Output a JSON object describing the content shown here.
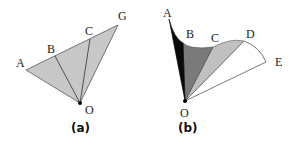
{
  "figures": [
    {
      "id": "a",
      "caption": "(a)",
      "description": "Triangle AGO divided into three wedges by segments OB and OC, all shaded light gray",
      "labels": {
        "A": "A",
        "B": "B",
        "C": "C",
        "G": "G",
        "O": "O"
      },
      "colors": {
        "fill": "#c8c8c8",
        "stroke": "#444444",
        "origin": "#000000"
      }
    },
    {
      "id": "b",
      "caption": "(b)",
      "description": "Curved fan region from O bounded by curve A-B-C-D-E, wedges shaded black, dark gray, light gray, white",
      "labels": {
        "A": "A",
        "B": "B",
        "C": "C",
        "D": "D",
        "E": "E",
        "O": "O"
      },
      "colors": {
        "wedge_OAB": "#0a0a0a",
        "wedge_OBC": "#7a7a7a",
        "wedge_OCD": "#c0c0c0",
        "wedge_ODE": "#ffffff",
        "stroke": "#444444"
      }
    }
  ]
}
